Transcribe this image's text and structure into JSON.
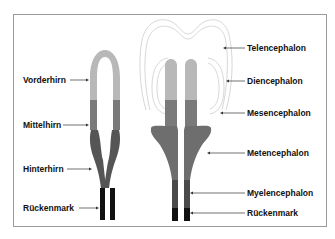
{
  "diagram": {
    "left_labels": [
      {
        "id": "vorderhirn",
        "text": "Vorderhirn"
      },
      {
        "id": "mittelhirn",
        "text": "Mittelhirn"
      },
      {
        "id": "hinterhirn",
        "text": "Hinterhirn"
      },
      {
        "id": "rueckenmark_left",
        "text": "Rückenmark"
      }
    ],
    "right_labels": [
      {
        "id": "telencephalon",
        "text": "Telencephalon"
      },
      {
        "id": "diencephalon",
        "text": "Diencephalon"
      },
      {
        "id": "mesencephalon",
        "text": "Mesencephalon"
      },
      {
        "id": "metencephalon",
        "text": "Metencephalon"
      },
      {
        "id": "myelencephalon",
        "text": "Myelencephalon"
      },
      {
        "id": "rueckenmark_right",
        "text": "Rückenmark"
      }
    ],
    "colors": {
      "forebrain": "#b8b8b8",
      "midbrain": "#7a7a7a",
      "hindbrain": "#555555",
      "metencephalon": "#6e6e6e",
      "myelencephalon": "#4a4a4a",
      "spinal_cord": "#111111",
      "outline": "#d8d8d8"
    }
  }
}
